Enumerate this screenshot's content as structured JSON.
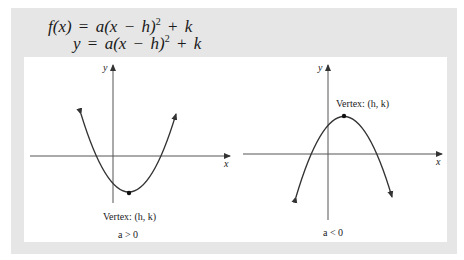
{
  "header": {
    "equation_1": {
      "lhs": "f(x)",
      "rhs_a": "a",
      "rhs_paren_open": "(x",
      "minus": "−",
      "h": "h)",
      "exp": "2",
      "plus": "+",
      "k": "k"
    },
    "equation_2": {
      "lhs": "y",
      "rhs_a": "a",
      "rhs_paren_open": "(x",
      "minus": "−",
      "h": "h)",
      "exp": "2",
      "plus": "+",
      "k": "k"
    },
    "eq_sign": "="
  },
  "graphs": [
    {
      "id": "upward",
      "x_axis_label": "x",
      "y_axis_label": "y",
      "vertex_label": "Vertex: (h, k)",
      "condition_label": "a > 0",
      "opens": "up"
    },
    {
      "id": "downward",
      "x_axis_label": "x",
      "y_axis_label": "y",
      "vertex_label": "Vertex: (h, k)",
      "condition_label": "a < 0",
      "opens": "down"
    }
  ],
  "colors": {
    "panel_bg": "#e6e6e6",
    "inner_bg": "#ffffff",
    "line": "#333333",
    "axis": "#555555"
  }
}
